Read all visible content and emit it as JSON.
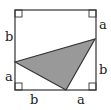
{
  "diagram": {
    "type": "geometry",
    "colors": {
      "stroke": "#333333",
      "fill_triangle": "#999999",
      "background": "#ffffff"
    },
    "square": {
      "x1": 15,
      "y1": 10,
      "x2": 96,
      "y2": 90
    },
    "triangle": {
      "vertices": [
        [
          15,
          62
        ],
        [
          95,
          39
        ],
        [
          66,
          90
        ]
      ]
    },
    "right_angle_markers": [
      "top-left",
      "top-right",
      "bottom-left",
      "bottom-right"
    ],
    "labels": {
      "left_top": "b",
      "left_bottom": "a",
      "right_top": "a",
      "right_bottom": "b",
      "bottom_left": "b",
      "bottom_right": "a"
    }
  }
}
